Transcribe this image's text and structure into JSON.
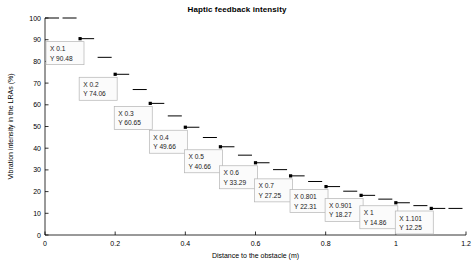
{
  "chart_data": {
    "type": "line",
    "title": "Haptic feedback intensity",
    "xlabel": "Distance to the obstacle (m)",
    "ylabel": "Vibration intensity in the LRAs (%)",
    "xlim": [
      0,
      1.2
    ],
    "ylim": [
      0,
      100
    ],
    "xticks": [
      0,
      0.2,
      0.4,
      0.6,
      0.8,
      1,
      1.2
    ],
    "xtick_labels": [
      "0",
      "0.2",
      "0.4",
      "0.6",
      "0.8",
      "1",
      "1.2"
    ],
    "yticks": [
      0,
      10,
      20,
      30,
      40,
      50,
      60,
      70,
      80,
      90,
      100
    ],
    "ytick_labels": [
      "0",
      "10",
      "20",
      "30",
      "40",
      "50",
      "60",
      "70",
      "80",
      "90",
      "100"
    ],
    "grid": false,
    "legend": null,
    "style": "stairs-with-markers",
    "x": [
      0,
      0.05,
      0.1,
      0.15,
      0.2,
      0.25,
      0.3,
      0.35,
      0.4,
      0.45,
      0.5,
      0.55,
      0.6,
      0.65,
      0.7,
      0.75,
      0.801,
      0.85,
      0.901,
      0.95,
      1,
      1.05,
      1.101,
      1.15
    ],
    "values": [
      100,
      100,
      90.48,
      81.87,
      74.06,
      67.03,
      60.65,
      54.88,
      49.66,
      44.93,
      40.66,
      36.79,
      33.29,
      30.12,
      27.25,
      24.66,
      22.31,
      20.19,
      18.27,
      16.53,
      14.86,
      13.53,
      12.25,
      12.25
    ],
    "series": [
      {
        "name": "Vibration intensity",
        "values": [
          100,
          100,
          90.48,
          81.87,
          74.06,
          67.03,
          60.65,
          54.88,
          49.66,
          44.93,
          40.66,
          36.79,
          33.29,
          30.12,
          27.25,
          24.66,
          22.31,
          20.19,
          18.27,
          16.53,
          14.86,
          13.53,
          12.25,
          12.25
        ]
      }
    ],
    "markers": [
      {
        "x": 0.1,
        "y": 90.48
      },
      {
        "x": 0.2,
        "y": 74.06
      },
      {
        "x": 0.3,
        "y": 60.65
      },
      {
        "x": 0.4,
        "y": 49.66
      },
      {
        "x": 0.5,
        "y": 40.66
      },
      {
        "x": 0.6,
        "y": 33.29
      },
      {
        "x": 0.7,
        "y": 27.25
      },
      {
        "x": 0.801,
        "y": 22.31
      },
      {
        "x": 0.901,
        "y": 18.27
      },
      {
        "x": 1,
        "y": 14.86
      },
      {
        "x": 1.101,
        "y": 12.25
      }
    ],
    "annotations": [
      {
        "id": "tip-1",
        "x_label": "X 0.1",
        "y_label": "Y 90.48",
        "x": 0.1,
        "y": 90.48
      },
      {
        "id": "tip-2",
        "x_label": "X 0.2",
        "y_label": "Y 74.06",
        "x": 0.2,
        "y": 74.06
      },
      {
        "id": "tip-3",
        "x_label": "X 0.3",
        "y_label": "Y 60.65",
        "x": 0.3,
        "y": 60.65
      },
      {
        "id": "tip-4",
        "x_label": "X 0.4",
        "y_label": "Y 49.66",
        "x": 0.4,
        "y": 49.66
      },
      {
        "id": "tip-5",
        "x_label": "X 0.5",
        "y_label": "Y 40.66",
        "x": 0.5,
        "y": 40.66
      },
      {
        "id": "tip-6",
        "x_label": "X 0.6",
        "y_label": "Y 33.29",
        "x": 0.6,
        "y": 33.29
      },
      {
        "id": "tip-7",
        "x_label": "X 0.7",
        "y_label": "Y 27.25",
        "x": 0.7,
        "y": 27.25
      },
      {
        "id": "tip-8",
        "x_label": "X 0.801",
        "y_label": "Y 22.31",
        "x": 0.801,
        "y": 22.31
      },
      {
        "id": "tip-9",
        "x_label": "X 0.901",
        "y_label": "Y 18.27",
        "x": 0.901,
        "y": 18.27
      },
      {
        "id": "tip-10",
        "x_label": "X 1",
        "y_label": "Y 14.86",
        "x": 1,
        "y": 14.86
      },
      {
        "id": "tip-11",
        "x_label": "X 1.101",
        "y_label": "Y 12.25",
        "x": 1.101,
        "y": 12.25
      }
    ],
    "colors": {
      "line": "#000000",
      "marker": "#000000",
      "axis": "#000000",
      "tip_border": "#b4b4b4",
      "tip_background": "#fbfbfb",
      "background": "#ffffff"
    }
  }
}
